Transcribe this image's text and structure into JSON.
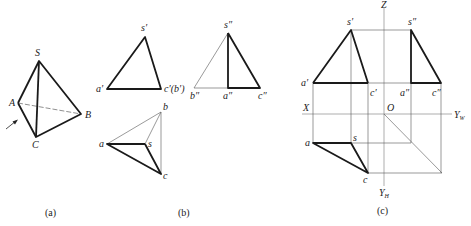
{
  "figure_a": {
    "caption": "(a)",
    "labels": {
      "S": "S",
      "A": "A",
      "B": "B",
      "C": "C"
    }
  },
  "figure_b": {
    "caption": "(b)",
    "front_view": {
      "s": "s′",
      "a": "a′",
      "cb": "c′(b′)"
    },
    "side_view": {
      "s": "s″",
      "b": "b″",
      "a": "a″",
      "c": "c″"
    },
    "top_view": {
      "b": "b",
      "a": "a",
      "s": "s",
      "c": "c"
    }
  },
  "figure_c": {
    "caption": "(c)",
    "axes": {
      "Z": "Z",
      "X": "X",
      "O": "O",
      "YW": "Y",
      "YW_sub": "W",
      "YH": "Y",
      "YH_sub": "H"
    },
    "front_view": {
      "s": "s′",
      "a": "a′",
      "c": "c′"
    },
    "side_view": {
      "s": "s″",
      "a": "a″",
      "c": "c″"
    },
    "top_view": {
      "a": "a",
      "s": "s",
      "c": "c"
    }
  },
  "colors": {
    "line": "#1a1a1a",
    "thin": "#555555",
    "background": "#ffffff"
  }
}
